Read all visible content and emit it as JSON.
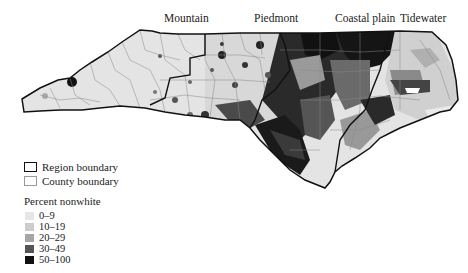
{
  "regions": {
    "labels": [
      {
        "name": "Mountain",
        "x": 164
      },
      {
        "name": "Piedmont",
        "x": 254
      },
      {
        "name": "Coastal plain",
        "x": 335
      },
      {
        "name": "Tidewater",
        "x": 400
      }
    ]
  },
  "legend": {
    "boundaries": [
      {
        "label": "Region boundary",
        "style": "thick"
      },
      {
        "label": "County boundary",
        "style": "thin"
      }
    ],
    "title": "Percent nonwhite",
    "classes": [
      {
        "label": "0–9",
        "color": "#e6e6e6"
      },
      {
        "label": "10–19",
        "color": "#cccccc"
      },
      {
        "label": "20–29",
        "color": "#a6a6a6"
      },
      {
        "label": "30–49",
        "color": "#555555"
      },
      {
        "label": "50–100",
        "color": "#111111"
      }
    ]
  }
}
